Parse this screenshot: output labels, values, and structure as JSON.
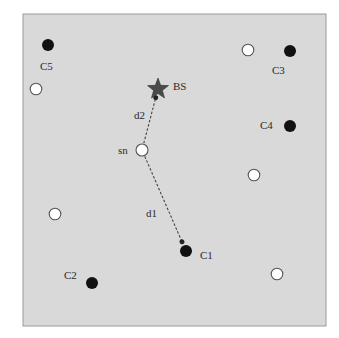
{
  "diagram": {
    "type": "network-topology",
    "background_color": "#d9d9d9",
    "frame": {
      "x": 23,
      "y": 14,
      "width": 303,
      "height": 312
    },
    "base_station": {
      "id": "BS",
      "label": "BS",
      "x": 158,
      "y": 89,
      "shape": "star",
      "color": "#4a4a4a"
    },
    "source_node": {
      "id": "sn",
      "label": "sn",
      "x": 142,
      "y": 150,
      "fill": "#ffffff"
    },
    "cluster_heads": [
      {
        "id": "C1",
        "label": "C1",
        "x": 186,
        "y": 251,
        "label_x": 200,
        "label_y": 259
      },
      {
        "id": "C2",
        "label": "C2",
        "x": 92,
        "y": 283,
        "label_x": 64,
        "label_y": 279
      },
      {
        "id": "C3",
        "label": "C3",
        "x": 290,
        "y": 51,
        "label_x": 272,
        "label_y": 74
      },
      {
        "id": "C4",
        "label": "C4",
        "x": 290,
        "y": 126,
        "label_x": 260,
        "label_y": 129
      },
      {
        "id": "C5",
        "label": "C5",
        "x": 48,
        "y": 45,
        "label_x": 40,
        "label_y": 70
      }
    ],
    "ordinary_nodes": [
      {
        "x": 36,
        "y": 89
      },
      {
        "x": 55,
        "y": 214
      },
      {
        "x": 248,
        "y": 50
      },
      {
        "x": 254,
        "y": 175
      },
      {
        "x": 277,
        "y": 274
      }
    ],
    "links": [
      {
        "id": "d1",
        "label": "d1",
        "from": "sn",
        "to": "C1",
        "style": "dashed-arrow",
        "label_x": 146,
        "label_y": 217
      },
      {
        "id": "d2",
        "label": "d2",
        "from": "sn",
        "to": "BS",
        "style": "dashed-arrow",
        "label_x": 134,
        "label_y": 119
      }
    ],
    "colors": {
      "cluster_head": "#111111",
      "ordinary_node_fill": "#ffffff",
      "ordinary_node_stroke": "#555555",
      "link": "#444444"
    }
  }
}
